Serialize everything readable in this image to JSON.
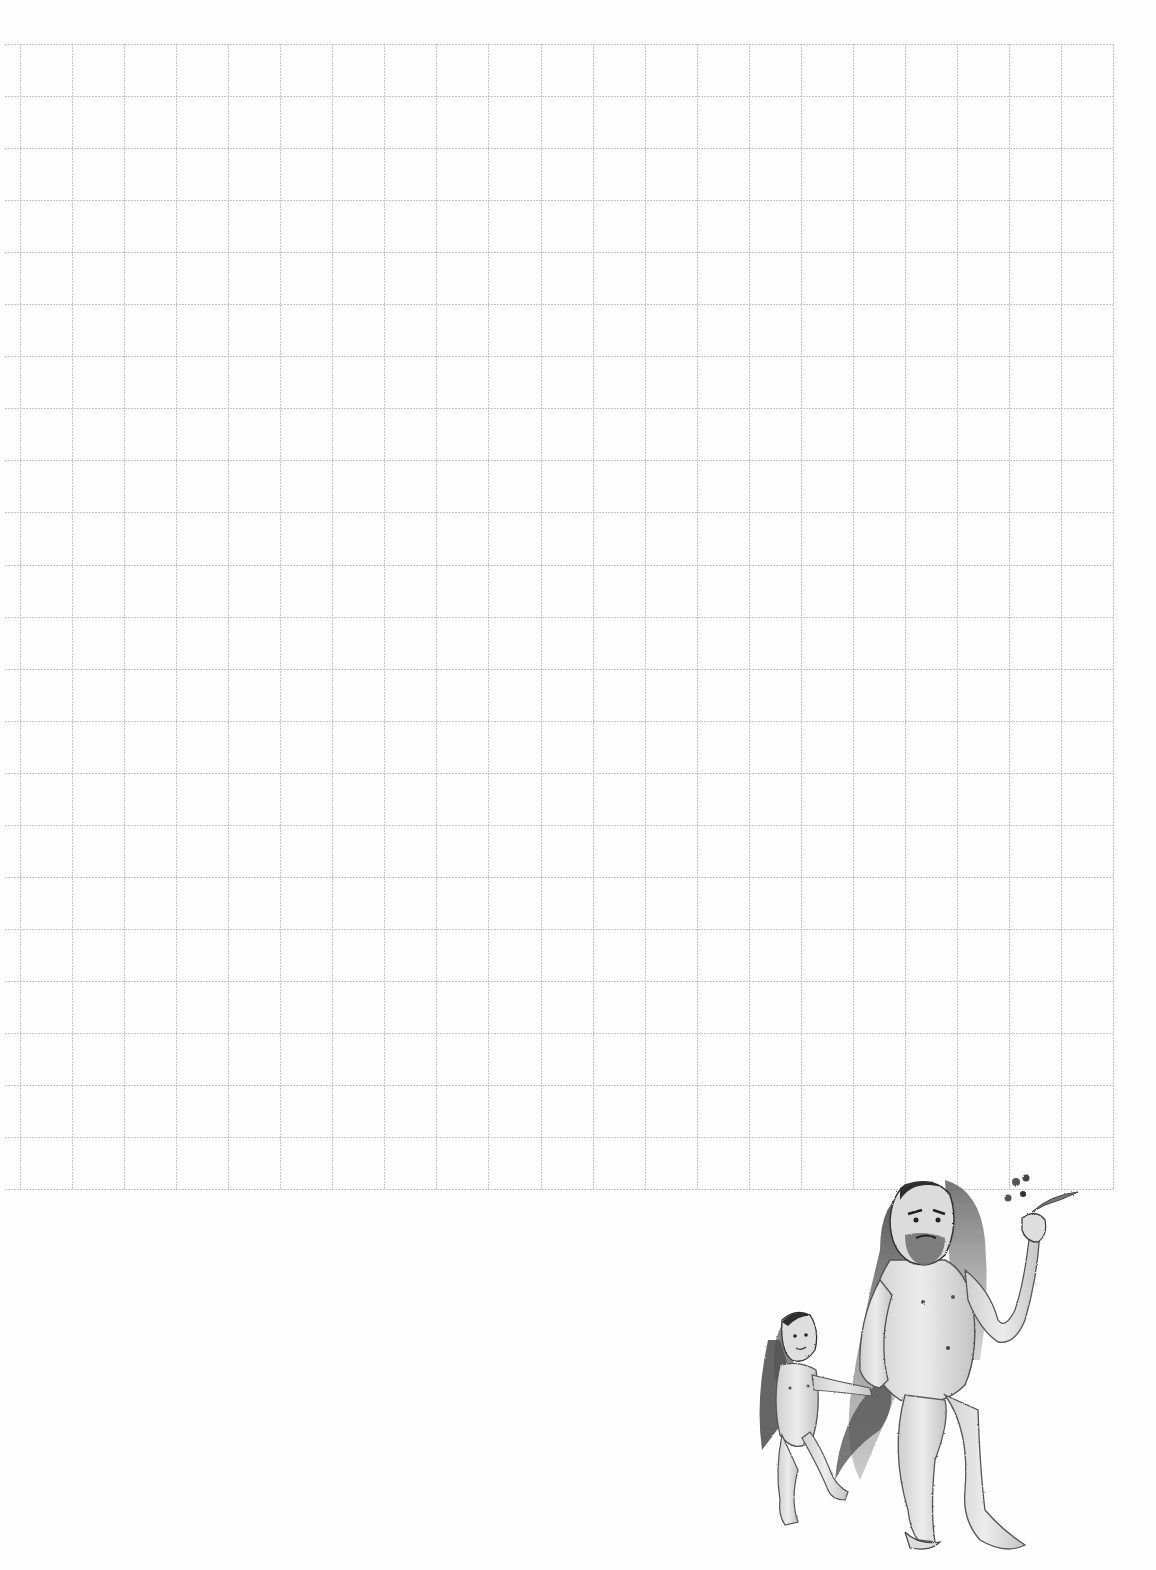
{
  "page": {
    "background": "#fefefe",
    "kind": "grid-paper-sheet"
  },
  "grid": {
    "left": 20,
    "top": 44,
    "cell": 52.05,
    "columns": 21,
    "rows": 22,
    "h_line_left_overhang": 15,
    "line_color": "#b8b8b8",
    "line_style": "dashed"
  },
  "illustration": {
    "subject": "sketch of two long-haired hairy humanoid figures walking; adult holds a leafy sprig, child holds adult's hand",
    "ink_color": "#4a4a4a",
    "shade_color": "#8c8c8c",
    "skin_color": "#e6e6e6"
  }
}
